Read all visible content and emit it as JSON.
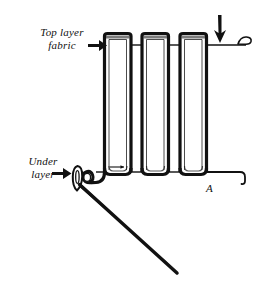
{
  "figure": {
    "background_color": "#ffffff",
    "ink_color": "#111111",
    "width": 264,
    "height": 284
  },
  "labels": {
    "top_layer": "Top layer\nfabric",
    "under_layer": "Under\nlayer",
    "point_a": "A"
  },
  "icons": {
    "arrow_right_top": "arrow-right-icon",
    "arrow_right_bottom": "arrow-right-icon",
    "arrow_down": "arrow-down-icon",
    "needle": "sewing-needle-icon",
    "thread_loop": "thread-loop-icon",
    "fabric_curl": "fabric-curl-icon"
  },
  "diagram_elements": {
    "pleat_count": 3,
    "pleat_tops_y": 34,
    "pleat_bottoms_y": 172,
    "underlayer_line_y": 172,
    "top_fabric_line_y": 45
  }
}
